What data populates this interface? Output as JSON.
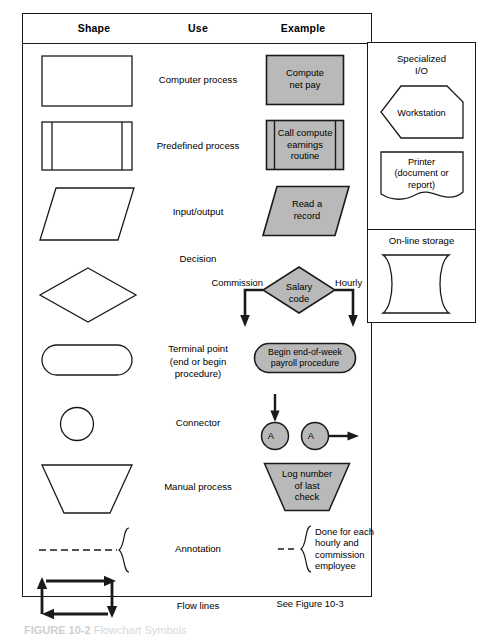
{
  "figure": {
    "caption_number": "FIGURE 10-2",
    "caption_title": "Flowchart Symbols"
  },
  "table": {
    "headers": [
      "Shape",
      "Use",
      "Example"
    ],
    "rows": [
      {
        "shape": "rectangle",
        "use": "Computer process",
        "example_text": "Compute\nnet pay",
        "example_shape": "rectangle"
      },
      {
        "shape": "predefined-process",
        "use": "Predefined process",
        "example_text": "Call compute\nearnings\nroutine",
        "example_shape": "predefined-process"
      },
      {
        "shape": "parallelogram",
        "use": "Input/output",
        "example_text": "Read a\nrecord",
        "example_shape": "parallelogram"
      },
      {
        "shape": "diamond",
        "use": "Decision",
        "example_text": "Salary\ncode",
        "example_shape": "diamond",
        "branch_left": "Commission",
        "branch_right": "Hourly"
      },
      {
        "shape": "stadium",
        "use": "Terminal point\n(end or begin\nprocedure)",
        "example_text": "Begin end-of-week\npayroll procedure",
        "example_shape": "stadium"
      },
      {
        "shape": "circle",
        "use": "Connector",
        "example_text": "A",
        "example_text_2": "A",
        "example_shape": "circle"
      },
      {
        "shape": "trapezoid",
        "use": "Manual process",
        "example_text": "Log number\nof last\ncheck",
        "example_shape": "trapezoid"
      },
      {
        "shape": "annotation-brace",
        "use": "Annotation",
        "example_text": "Done for each\nhourly and\ncommission\nemployee",
        "example_shape": "annotation-brace"
      },
      {
        "shape": "flow-lines",
        "use": "Flow lines",
        "example_text": "See Figure 10-3",
        "example_shape": "text"
      }
    ]
  },
  "right_panel": {
    "sections": [
      {
        "title": "Specialized\nI/O",
        "items": [
          {
            "label": "Workstation",
            "shape": "workstation-pentagon"
          },
          {
            "label": "Printer\n(document or\nreport)",
            "shape": "document"
          }
        ]
      },
      {
        "title": "On-line storage",
        "items": [
          {
            "label": "",
            "shape": "online-storage"
          }
        ]
      }
    ]
  },
  "colors": {
    "fill_gray": "#b9b9b9",
    "stroke": "#1a1a1a",
    "background": "#ffffff"
  }
}
